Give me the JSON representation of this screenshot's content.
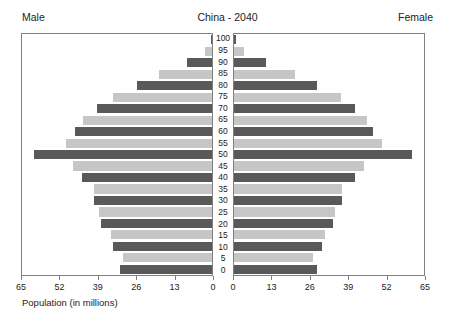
{
  "header": {
    "male_label": "Male",
    "title": "China - 2040",
    "female_label": "Female"
  },
  "xlabel": "Population (in millions)",
  "colors": {
    "dark_bar": "#595959",
    "light_bar": "#c6c6c6",
    "frame": "#808080",
    "text": "#222222"
  },
  "chart_data": {
    "type": "bar",
    "subtype": "population-pyramid",
    "title": "China - 2040",
    "xlabel": "Population (in millions)",
    "ylabel": "",
    "grid": false,
    "legend": "none",
    "left_axis": {
      "name": "Male",
      "ticks": [
        65,
        52,
        39,
        26,
        13,
        0
      ],
      "tick_labels": [
        "65",
        "52",
        "39",
        "26",
        "13",
        "0"
      ],
      "range": [
        65,
        0
      ],
      "direction": "reversed"
    },
    "right_axis": {
      "name": "Female",
      "ticks": [
        0,
        13,
        26,
        39,
        52,
        65
      ],
      "tick_labels": [
        "0",
        "13",
        "26",
        "39",
        "52",
        "65"
      ],
      "range": [
        0,
        65
      ],
      "direction": "normal"
    },
    "categories": [
      "0",
      "5",
      "10",
      "15",
      "20",
      "25",
      "30",
      "35",
      "40",
      "45",
      "50",
      "55",
      "60",
      "65",
      "70",
      "75",
      "80",
      "85",
      "90",
      "95",
      "100"
    ],
    "age_labels": [
      "100",
      "95",
      "90",
      "85",
      "80",
      "75",
      "70",
      "65",
      "60",
      "55",
      "50",
      "45",
      "40",
      "35",
      "30",
      "25",
      "20",
      "15",
      "10",
      "5",
      "0"
    ],
    "series": [
      {
        "name": "Male",
        "side": "left",
        "values": [
          31.5,
          30.5,
          34.0,
          34.5,
          38.0,
          38.5,
          40.5,
          40.5,
          44.5,
          47.5,
          61.0,
          50.0,
          47.0,
          44.0,
          39.5,
          34.0,
          25.5,
          18.0,
          8.5,
          2.5,
          0.4
        ]
      },
      {
        "name": "Female",
        "side": "right",
        "values": [
          28.5,
          27.0,
          30.0,
          31.0,
          34.0,
          34.5,
          37.0,
          37.0,
          41.5,
          44.5,
          61.0,
          50.5,
          47.5,
          45.5,
          41.5,
          36.5,
          28.5,
          21.0,
          11.0,
          3.5,
          0.6
        ]
      }
    ],
    "bar_color_pattern": [
      "dark",
      "light",
      "dark",
      "light",
      "dark",
      "light",
      "dark",
      "light",
      "dark",
      "light",
      "dark",
      "light",
      "dark",
      "light",
      "dark",
      "light",
      "dark",
      "light",
      "dark",
      "light",
      "dark"
    ]
  }
}
